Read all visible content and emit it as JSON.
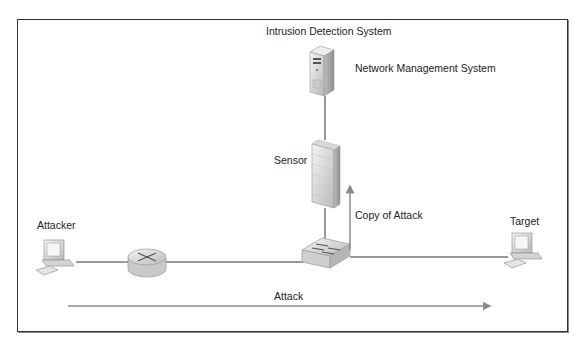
{
  "diagram": {
    "title_label": "Intrusion Detection System",
    "nodes": {
      "nms": {
        "label": "Network Management System",
        "icon": "server-icon"
      },
      "sensor": {
        "label": "Sensor",
        "icon": "firewall-icon"
      },
      "attacker": {
        "label": "Attacker",
        "icon": "desktop-computer-icon"
      },
      "router": {
        "icon": "router-icon"
      },
      "switch": {
        "icon": "switch-icon"
      },
      "target": {
        "label": "Target",
        "icon": "desktop-computer-icon"
      }
    },
    "arrows": {
      "copy": {
        "label": "Copy of Attack",
        "direction": "up"
      },
      "attack": {
        "label": "Attack",
        "direction": "right"
      }
    },
    "edges": [
      [
        "attacker",
        "router"
      ],
      [
        "router",
        "switch"
      ],
      [
        "switch",
        "target"
      ],
      [
        "switch",
        "sensor"
      ],
      [
        "sensor",
        "nms"
      ]
    ],
    "colors": {
      "frame": "#333333",
      "line": "#333333",
      "arrow": "#8a8a8a",
      "device_fill": "#dcdcdc"
    }
  }
}
